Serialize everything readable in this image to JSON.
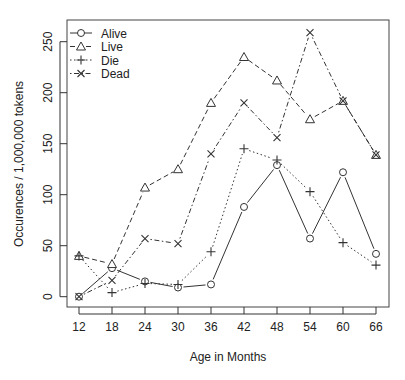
{
  "chart_data": {
    "type": "line",
    "title": "",
    "xlabel": "Age in Months",
    "ylabel": "Occurences / 1,000,000 tokens",
    "x": [
      12,
      18,
      24,
      30,
      36,
      42,
      48,
      54,
      60,
      66
    ],
    "xticks": [
      "12",
      "18",
      "24",
      "30",
      "36",
      "42",
      "48",
      "54",
      "60",
      "66"
    ],
    "yticks": [
      0,
      50,
      100,
      150,
      200,
      250
    ],
    "ylim": [
      0,
      260
    ],
    "grid": false,
    "legend_position": "top-left",
    "series": [
      {
        "name": "Alive",
        "marker": "circle",
        "linestyle": "solid",
        "values": [
          0,
          28,
          15,
          9,
          12,
          88,
          129,
          57,
          122,
          42
        ]
      },
      {
        "name": "Live",
        "marker": "triangle",
        "linestyle": "dashed",
        "values": [
          40,
          32,
          107,
          125,
          190,
          235,
          212,
          174,
          192,
          139
        ]
      },
      {
        "name": "Die",
        "marker": "plus",
        "linestyle": "dotted",
        "values": [
          40,
          4,
          13,
          12,
          44,
          145,
          134,
          103,
          53,
          31
        ]
      },
      {
        "name": "Dead",
        "marker": "x",
        "linestyle": "dotdash",
        "values": [
          0,
          16,
          57,
          52,
          140,
          190,
          156,
          259,
          192,
          139
        ]
      }
    ]
  }
}
